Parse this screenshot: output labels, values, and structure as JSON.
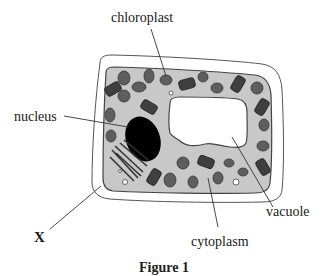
{
  "figure": {
    "type": "plant cell diagram",
    "caption": "Figure 1",
    "labels": {
      "chloroplast": "chloroplast",
      "nucleus": "nucleus",
      "vacuole": "vacuole",
      "cytoplasm": "cytoplasm",
      "x": "X"
    },
    "colors": {
      "cell_wall_fill": "#ffffff",
      "cytoplasm": "#c8c8c8",
      "outline": "#444444",
      "organelle": "#5a5a5a",
      "nucleus": "#000000",
      "vacuole": "#ffffff"
    }
  }
}
